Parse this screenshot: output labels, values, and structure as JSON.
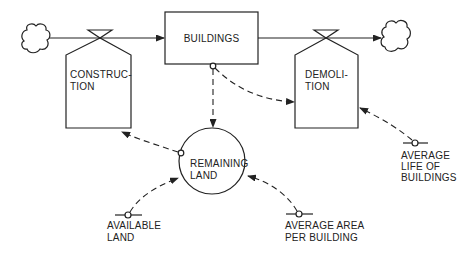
{
  "diagram": {
    "type": "system-dynamics stock-and-flow",
    "colors": {
      "line": "#222222",
      "background": "#ffffff"
    },
    "stock": {
      "label": "BUILDINGS"
    },
    "flows": [
      {
        "id": "construction",
        "label_line1": "CONSTRUC-",
        "label_line2": "TION"
      },
      {
        "id": "demolition",
        "label_line1": "DEMOLI-",
        "label_line2": "TION"
      }
    ],
    "auxiliary": {
      "label_line1": "REMAINING",
      "label_line2": "LAND"
    },
    "constants": [
      {
        "id": "available-land",
        "label_line1": "AVAILABLE",
        "label_line2": "LAND"
      },
      {
        "id": "average-area-per-building",
        "label_line1": "AVERAGE AREA",
        "label_line2": "PER BUILDING"
      },
      {
        "id": "average-life-of-buildings",
        "label_line1": "AVERAGE",
        "label_line2": "LIFE OF",
        "label_line3": "BUILDINGS"
      }
    ],
    "sources_sinks": [
      {
        "id": "source-cloud",
        "icon": "cloud-icon"
      },
      {
        "id": "sink-cloud",
        "icon": "cloud-icon"
      }
    ],
    "links": [
      {
        "from": "BUILDINGS",
        "to": "REMAINING LAND"
      },
      {
        "from": "BUILDINGS",
        "to": "DEMOLITION"
      },
      {
        "from": "REMAINING LAND",
        "to": "CONSTRUCTION"
      },
      {
        "from": "AVAILABLE LAND",
        "to": "REMAINING LAND"
      },
      {
        "from": "AVERAGE AREA PER BUILDING",
        "to": "REMAINING LAND"
      },
      {
        "from": "AVERAGE LIFE OF BUILDINGS",
        "to": "DEMOLITION"
      }
    ]
  }
}
